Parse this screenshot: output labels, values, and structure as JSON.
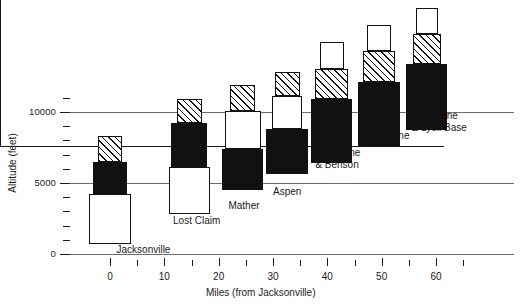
{
  "chart_data": {
    "type": "bar",
    "title": "",
    "xlabel": "Miles (from Jacksonville)",
    "ylabel": "Altitude (feet)",
    "xlim": [
      -5,
      65
    ],
    "ylim": [
      0,
      12500
    ],
    "grid": "horizontal gridlines at 0, 5000, 10000",
    "legend": "none",
    "y_ticks_major": [
      {
        "value": 0,
        "label": "0"
      },
      {
        "value": 5000,
        "label": "5000"
      },
      {
        "value": 10000,
        "label": "10000"
      }
    ],
    "y_ticks_minor": [
      1000,
      2000,
      3000,
      4000,
      6000,
      7000,
      8000,
      9000,
      11000
    ],
    "x_ticks_major": [
      {
        "value": 0,
        "label": "0"
      },
      {
        "value": 10,
        "label": "10"
      },
      {
        "value": 20,
        "label": "20"
      },
      {
        "value": 30,
        "label": "30"
      },
      {
        "value": 40,
        "label": "40"
      },
      {
        "value": 50,
        "label": "50"
      },
      {
        "value": 60,
        "label": "60"
      }
    ],
    "x_ticks_minor": [
      5,
      15,
      25,
      35,
      45,
      55,
      65
    ],
    "note": "Each station is a stack of nested boxes of different widths; box fill encodes a category (white / black / hatched).",
    "stations": [
      {
        "name": "Jacksonville",
        "label": "Jacksonville",
        "x_center": 0,
        "label_x": 1.2,
        "label_y": 300,
        "label_align": "left",
        "segments": [
          {
            "fill": "white",
            "y0": 700,
            "y1": 4200,
            "width_mi": 7.6
          },
          {
            "fill": "black",
            "y0": 4200,
            "y1": 6500,
            "width_mi": 6.4
          },
          {
            "fill": "hatch",
            "y0": 6500,
            "y1": 8300,
            "width_mi": 4.6
          }
        ]
      },
      {
        "name": "Lost Claim",
        "label": "Lost Claim",
        "x_center": 14.6,
        "label_x": 11.6,
        "label_y": 2300,
        "label_align": "left",
        "segments": [
          {
            "fill": "white",
            "y0": 2800,
            "y1": 6100,
            "width_mi": 7.6
          },
          {
            "fill": "black",
            "y0": 6100,
            "y1": 9200,
            "width_mi": 6.6
          },
          {
            "fill": "hatch",
            "y0": 9200,
            "y1": 10900,
            "width_mi": 4.6
          }
        ]
      },
      {
        "name": "Mather",
        "label": "Mather",
        "x_center": 24.4,
        "label_x": 21.8,
        "label_y": 3350,
        "label_align": "left",
        "segments": [
          {
            "fill": "black",
            "y0": 4500,
            "y1": 7400,
            "width_mi": 7.6
          },
          {
            "fill": "white",
            "y0": 7400,
            "y1": 10100,
            "width_mi": 6.6
          },
          {
            "fill": "hatch",
            "y0": 10100,
            "y1": 11900,
            "width_mi": 4.6
          }
        ]
      },
      {
        "name": "Aspen",
        "label": "Aspen",
        "x_center": 32.6,
        "label_x": 30.0,
        "label_y": 4350,
        "label_align": "left",
        "segments": [
          {
            "fill": "black",
            "y0": 5600,
            "y1": 8800,
            "width_mi": 7.6
          },
          {
            "fill": "white",
            "y0": 8800,
            "y1": 11100,
            "width_mi": 5.4
          },
          {
            "fill": "hatch",
            "y0": 11100,
            "y1": 12800,
            "width_mi": 4.6
          }
        ]
      },
      {
        "name": "Porcupine & Benson",
        "label": "Porcupine\n& Benson",
        "x_center": 40.8,
        "label_x": 37.8,
        "label_y": 7100,
        "label_align": "left",
        "segments": [
          {
            "fill": "black",
            "y0": 6400,
            "y1": 10900,
            "width_mi": 7.6
          },
          {
            "fill": "hatch",
            "y0": 10900,
            "y1": 13000,
            "width_mi": 6.0
          },
          {
            "fill": "white",
            "y0": 13000,
            "y1": 14900,
            "width_mi": 4.4
          }
        ]
      },
      {
        "name": "Tuolumne",
        "label": "Tuolumne",
        "x_center": 49.5,
        "label_x": 47.0,
        "label_y": 8300,
        "label_align": "left",
        "segments": [
          {
            "fill": "black",
            "y0": 7600,
            "y1": 12100,
            "width_mi": 7.6
          },
          {
            "fill": "hatch",
            "y0": 12100,
            "y1": 14300,
            "width_mi": 6.0
          },
          {
            "fill": "white",
            "y0": 14300,
            "y1": 16100,
            "width_mi": 4.4
          }
        ]
      },
      {
        "name": "Timberline & Lyell Base",
        "label": "Timberline\n& Lyell Base",
        "x_center": 58.3,
        "label_x": 55.5,
        "label_y": 9700,
        "label_align": "left",
        "segments": [
          {
            "fill": "black",
            "y0": 8700,
            "y1": 13400,
            "width_mi": 7.6
          },
          {
            "fill": "hatch",
            "y0": 13400,
            "y1": 15500,
            "width_mi": 5.2
          },
          {
            "fill": "white",
            "y0": 15500,
            "y1": 17300,
            "width_mi": 4.0
          }
        ]
      }
    ]
  }
}
